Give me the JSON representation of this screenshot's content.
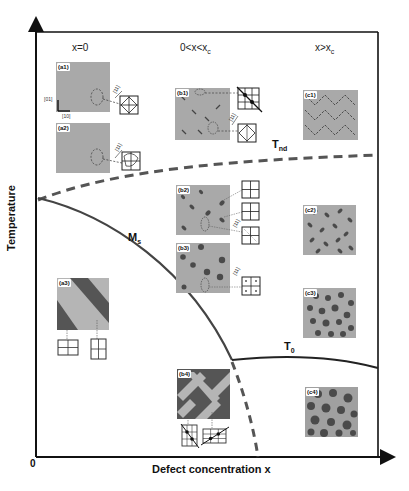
{
  "diagram": {
    "type": "phase-diagram",
    "axes": {
      "x_label": "Defect concentration  x",
      "y_label": "Temperature",
      "origin": "0"
    },
    "columns": [
      {
        "id": "col-x0",
        "label": "x=0"
      },
      {
        "id": "col-mid",
        "label": "0<x<xc",
        "label_main": "0<x<x",
        "label_sub": "c"
      },
      {
        "id": "col-high",
        "label": "x>xc",
        "label_main": "x>x",
        "label_sub": "c"
      }
    ],
    "curves": [
      {
        "id": "Tnd",
        "label_main": "T",
        "label_sub": "nd",
        "style": "dashed",
        "color": "#555555"
      },
      {
        "id": "Ms",
        "label_main": "M",
        "label_sub": "s",
        "style": "solid",
        "color": "#444444"
      },
      {
        "id": "T0",
        "label_main": "T",
        "label_sub": "0",
        "style": "solid",
        "color": "#222222"
      },
      {
        "id": "boundary",
        "label_main": "",
        "label_sub": "",
        "style": "dashed",
        "color": "#555555"
      }
    ],
    "insets": [
      {
        "id": "a1",
        "tag": "(a1)",
        "pattern": "uniform"
      },
      {
        "id": "a2",
        "tag": "(a2)",
        "pattern": "uniform"
      },
      {
        "id": "a3",
        "tag": "(a3)",
        "pattern": "twin-stripes"
      },
      {
        "id": "b1",
        "tag": "(b1)",
        "pattern": "sparse-dimers"
      },
      {
        "id": "b2",
        "tag": "(b2)",
        "pattern": "sparse-nanodomains"
      },
      {
        "id": "b3",
        "tag": "(b3)",
        "pattern": "sparse-round-domains"
      },
      {
        "id": "b4",
        "tag": "(b4)",
        "pattern": "herringbone"
      },
      {
        "id": "c1",
        "tag": "(c1)",
        "pattern": "dense-dimers"
      },
      {
        "id": "c2",
        "tag": "(c2)",
        "pattern": "dense-nanodomains"
      },
      {
        "id": "c3",
        "tag": "(c3)",
        "pattern": "dense-round-domains"
      },
      {
        "id": "c4",
        "tag": "(c4)",
        "pattern": "dense-large-domains"
      }
    ],
    "direction_labels": {
      "d01": "[01]",
      "d10": "[10]",
      "d11": "[11]"
    },
    "colors": {
      "axis": "#111111",
      "inset_bg": "#a9a9a9",
      "domain_dark": "#4a4a4a",
      "stripe_dark": "#555555",
      "stripe_light": "#b5b5b5"
    }
  }
}
